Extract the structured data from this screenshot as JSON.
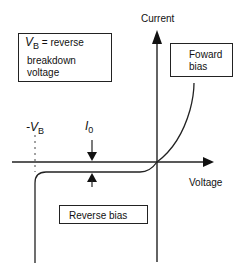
{
  "diagram": {
    "type": "diode I-V characteristic",
    "axes": {
      "y_label": "Current",
      "x_label": "Voltage"
    },
    "legend_box": {
      "symbol": "V",
      "subscript": "B",
      "line1_suffix": " = reverse",
      "line2": "breakdown",
      "line3": "voltage"
    },
    "forward_box": {
      "line1": "Foward",
      "line2": "bias"
    },
    "reverse_box": {
      "label": "Reverse bias"
    },
    "markers": {
      "neg_vb_prefix": "-V",
      "neg_vb_sub": "B",
      "i0_symbol": "I",
      "i0_sub": "0"
    },
    "colors": {
      "line": "#222222",
      "background": "#ffffff"
    }
  }
}
